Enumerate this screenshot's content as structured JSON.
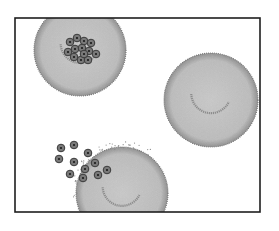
{
  "diagram": {
    "colors": {
      "background": "#ffffff",
      "frame": "#1e1e1e",
      "cell_fill": "#b9b9b9",
      "cell_edge": "#6e6e6e",
      "parasite_fill": "#7a7a7a",
      "parasite_ring": "#3a3a3a",
      "parasite_dot": "#1a1a1a"
    },
    "frame": {
      "x": 15,
      "y": 18,
      "w": 245,
      "h": 194
    },
    "cells": [
      {
        "name": "infected-cell-with-schizont",
        "cx": 80,
        "cy": 50,
        "r": 46
      },
      {
        "name": "uninfected-cell",
        "cx": 211,
        "cy": 100,
        "r": 47
      },
      {
        "name": "rupturing-cell",
        "cx": 122,
        "cy": 193,
        "r": 46
      }
    ],
    "schizont_merozoites": [
      [
        70,
        42
      ],
      [
        77,
        38
      ],
      [
        84,
        41
      ],
      [
        91,
        43
      ],
      [
        68,
        52
      ],
      [
        75,
        49
      ],
      [
        82,
        48
      ],
      [
        89,
        51
      ],
      [
        96,
        54
      ],
      [
        74,
        57
      ],
      [
        81,
        60
      ],
      [
        88,
        60
      ],
      [
        84,
        54
      ]
    ],
    "released_merozoites": [
      [
        61,
        148
      ],
      [
        74,
        145
      ],
      [
        59,
        159
      ],
      [
        74,
        162
      ],
      [
        88,
        153
      ],
      [
        95,
        163
      ],
      [
        85,
        169
      ],
      [
        70,
        174
      ],
      [
        83,
        178
      ],
      [
        98,
        175
      ],
      [
        107,
        170
      ]
    ]
  }
}
